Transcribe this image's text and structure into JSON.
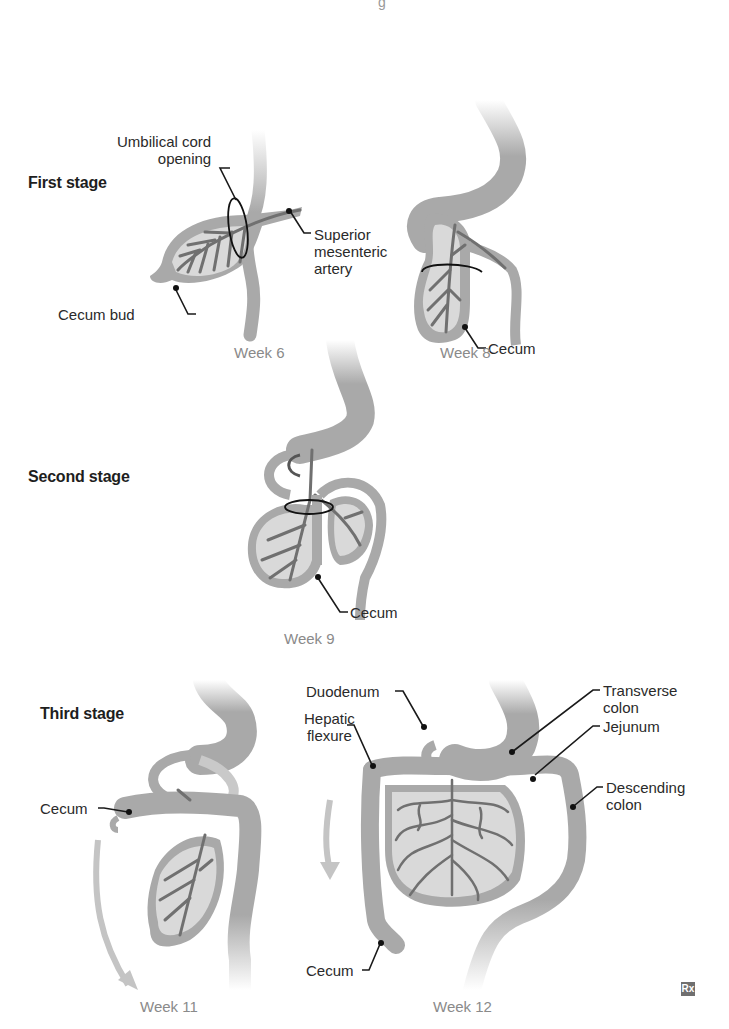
{
  "top_fragment": "g",
  "stages": [
    {
      "title": "First stage",
      "panels": [
        {
          "week": "Week 6",
          "labels": [
            "Umbilical cord opening",
            "Superior mesenteric artery",
            "Cecum bud"
          ]
        },
        {
          "week": "Week 8",
          "labels": [
            "Cecum"
          ]
        }
      ]
    },
    {
      "title": "Second stage",
      "panels": [
        {
          "week": "Week 9",
          "labels": [
            "Cecum"
          ]
        }
      ]
    },
    {
      "title": "Third stage",
      "panels": [
        {
          "week": "Week 11",
          "labels": [
            "Cecum"
          ]
        },
        {
          "week": "Week 12",
          "labels": [
            "Duodenum",
            "Hepatic flexure",
            "Transverse colon",
            "Jejunum",
            "Descending colon",
            "Cecum"
          ]
        }
      ]
    }
  ],
  "text": {
    "umbilical_1": "Umbilical cord",
    "umbilical_2": "opening",
    "sma_1": "Superior",
    "sma_2": "mesenteric",
    "sma_3": "artery",
    "cecum_bud": "Cecum bud",
    "cecum": "Cecum",
    "duodenum": "Duodenum",
    "hepatic_1": "Hepatic",
    "hepatic_2": "flexure",
    "transverse_1": "Transverse",
    "transverse_2": "colon",
    "jejunum": "Jejunum",
    "descending_1": "Descending",
    "descending_2": "colon"
  },
  "logo": "Rx",
  "colors": {
    "gut_tissue": "#a9a9a9",
    "mesentery_fill": "#d9d9d9",
    "vessels": "#707070",
    "leader_lines": "#1a1a1a",
    "week_labels": "#8a8a8a",
    "arrow": "#c4c4c4"
  }
}
